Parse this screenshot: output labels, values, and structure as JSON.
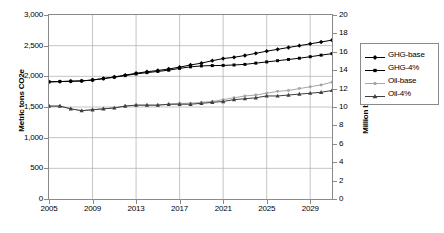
{
  "chart_data": {
    "type": "line",
    "title": "",
    "xlabel": "",
    "ylabel": "Metric tons CO2e",
    "ylabel_secondary": "Million barrels/day",
    "grid": true,
    "legend_position": "right",
    "xlim": [
      2005,
      2031
    ],
    "ylim": [
      0,
      3000
    ],
    "ylim_secondary": [
      0,
      20
    ],
    "x": [
      2005,
      2006,
      2007,
      2008,
      2009,
      2010,
      2011,
      2012,
      2013,
      2014,
      2015,
      2016,
      2017,
      2018,
      2019,
      2020,
      2021,
      2022,
      2023,
      2024,
      2025,
      2026,
      2027,
      2028,
      2029,
      2030,
      2031
    ],
    "xticks": [
      2005,
      2009,
      2013,
      2017,
      2021,
      2025,
      2029
    ],
    "xtick_labels": [
      "2005",
      "2009",
      "2013",
      "2017",
      "2021",
      "2025",
      "2029"
    ],
    "yticks": [
      0,
      500,
      1000,
      1500,
      2000,
      2500,
      3000
    ],
    "ytick_labels": [
      "0",
      "500",
      "1,000",
      "1,500",
      "2,000",
      "2,500",
      "3,000"
    ],
    "yticks_secondary": [
      0,
      2,
      4,
      6,
      8,
      10,
      12,
      14,
      16,
      18,
      20
    ],
    "ytick_labels_secondary": [
      "0",
      "2",
      "4",
      "6",
      "8",
      "10",
      "12",
      "14",
      "16",
      "18",
      "20"
    ],
    "series": [
      {
        "name": "GHG-base",
        "axis": "left",
        "marker": "diamond",
        "color": "#000000",
        "values": [
          1910,
          1915,
          1920,
          1925,
          1940,
          1965,
          1990,
          2020,
          2050,
          2075,
          2095,
          2120,
          2150,
          2185,
          2215,
          2255,
          2290,
          2310,
          2340,
          2375,
          2410,
          2440,
          2470,
          2500,
          2530,
          2560,
          2590
        ]
      },
      {
        "name": "GHG-4%",
        "axis": "left",
        "marker": "square",
        "color": "#000000",
        "values": [
          1910,
          1915,
          1920,
          1925,
          1940,
          1962,
          1985,
          2012,
          2040,
          2060,
          2080,
          2100,
          2130,
          2155,
          2170,
          2175,
          2178,
          2185,
          2195,
          2215,
          2235,
          2255,
          2275,
          2295,
          2320,
          2345,
          2370
        ]
      },
      {
        "name": "Oil-base",
        "axis": "right",
        "marker": "circle",
        "color": "#a6a6a6",
        "values": [
          10.1,
          10.1,
          9.8,
          9.6,
          9.7,
          9.8,
          9.9,
          10.1,
          10.2,
          10.2,
          10.2,
          10.3,
          10.4,
          10.4,
          10.5,
          10.6,
          10.8,
          11.0,
          11.2,
          11.3,
          11.5,
          11.7,
          11.8,
          12.0,
          12.2,
          12.4,
          12.7
        ]
      },
      {
        "name": "Oil-4%",
        "axis": "right",
        "marker": "triangle",
        "color": "#3f3f3f",
        "values": [
          10.1,
          10.1,
          9.8,
          9.6,
          9.7,
          9.8,
          9.9,
          10.1,
          10.2,
          10.2,
          10.2,
          10.3,
          10.3,
          10.3,
          10.4,
          10.5,
          10.6,
          10.8,
          10.9,
          11.0,
          11.2,
          11.2,
          11.3,
          11.4,
          11.5,
          11.6,
          11.8
        ]
      }
    ]
  },
  "legend": {
    "items": [
      {
        "label": "GHG-base"
      },
      {
        "label": "GHG-4%"
      },
      {
        "label": "Oil-base"
      },
      {
        "label": "Oil-4%"
      }
    ]
  }
}
